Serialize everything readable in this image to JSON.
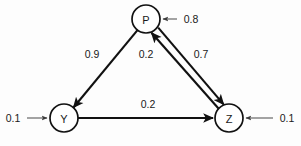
{
  "diagram": {
    "background_color": "#fdfdfd",
    "stroke_color": "#111111",
    "input_stroke_color": "#5a5a5a"
  },
  "nodes": [
    {
      "id": "P",
      "label": "P",
      "cx": 146,
      "cy": 19,
      "r": 14
    },
    {
      "id": "Y",
      "label": "Y",
      "cx": 64,
      "cy": 118,
      "r": 14
    },
    {
      "id": "Z",
      "label": "Z",
      "cx": 229,
      "cy": 118,
      "r": 14
    }
  ],
  "edges": [
    {
      "id": "p-to-y",
      "from": "P",
      "to": "Y",
      "weight": "0.9",
      "label_x": 92,
      "label_y": 54
    },
    {
      "id": "z-to-p",
      "from": "Z",
      "to": "P",
      "weight": "0.2",
      "label_x": 146,
      "label_y": 54
    },
    {
      "id": "p-to-z",
      "from": "P",
      "to": "Z",
      "weight": "0.7",
      "label_x": 201,
      "label_y": 54
    },
    {
      "id": "y-to-z",
      "from": "Y",
      "to": "Z",
      "weight": "0.2",
      "label_x": 148,
      "label_y": 104
    }
  ],
  "inputs": [
    {
      "id": "input-p",
      "target": "P",
      "weight": "0.8",
      "label_x": 191,
      "label_y": 19,
      "direction": "left"
    },
    {
      "id": "input-y",
      "target": "Y",
      "weight": "0.1",
      "label_x": 13,
      "label_y": 118,
      "direction": "right"
    },
    {
      "id": "input-z",
      "target": "Z",
      "weight": "0.1",
      "label_x": 287,
      "label_y": 118,
      "direction": "left"
    }
  ]
}
